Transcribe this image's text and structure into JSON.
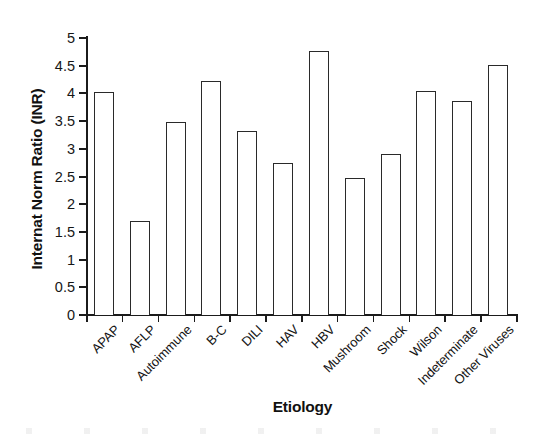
{
  "chart_data": {
    "type": "bar",
    "title": "",
    "xlabel": "Etiology",
    "ylabel": "Internat Norm Ratio (INR)",
    "ylim": [
      0,
      5
    ],
    "y_ticks": [
      0,
      0.5,
      1,
      1.5,
      2,
      2.5,
      3,
      3.5,
      4,
      4.5,
      5
    ],
    "y_tick_labels": [
      "0",
      "0.5",
      "1",
      "1.5",
      "2",
      "2.5",
      "3",
      "3.5",
      "4",
      "4.5",
      "5"
    ],
    "grid": false,
    "legend": "none",
    "bar_style": {
      "fill": "#ffffff",
      "edge": "#2a2a2a"
    },
    "categories": [
      "APAP",
      "AFLP",
      "Autoimmune",
      "B-C",
      "DILI",
      "HAV",
      "HBV",
      "Mushroom",
      "Shock",
      "Wilson",
      "Indeterminate",
      "Other Viruses"
    ],
    "values": [
      4.02,
      1.7,
      3.48,
      4.22,
      3.32,
      2.74,
      4.77,
      2.47,
      2.91,
      4.05,
      3.86,
      4.51
    ]
  },
  "axes": {
    "y_title": "Internat Norm Ratio (INR)",
    "x_title": "Etiology"
  }
}
